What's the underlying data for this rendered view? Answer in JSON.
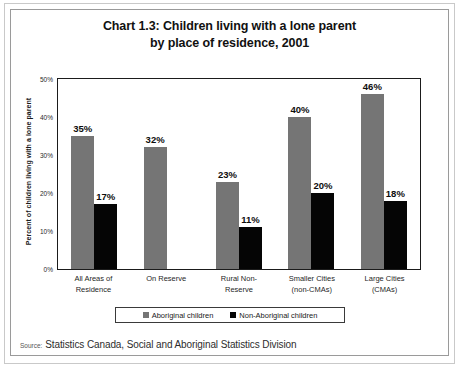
{
  "frame": {
    "title_line1": "Chart 1.3: Children living with a lone parent",
    "title_line2": "by place of residence, 2001"
  },
  "source": {
    "label": "Source:",
    "text": "Statistics Canada, Social and Aboriginal Statistics Division"
  },
  "legend": {
    "items": [
      {
        "label": "Aboriginal children",
        "color": "#757575"
      },
      {
        "label": "Non-Aboriginal children",
        "color": "#050505"
      }
    ]
  },
  "chart_data": {
    "type": "bar",
    "title": "Chart 1.3: Children living with a lone parent by place of residence, 2001",
    "xlabel": "",
    "ylabel": "Percent of children living with a lone parent",
    "ylim": [
      0,
      50
    ],
    "yticks": [
      0,
      10,
      20,
      30,
      40,
      50
    ],
    "ytick_labels": [
      "0%",
      "10%",
      "20%",
      "30%",
      "40%",
      "50%"
    ],
    "grid": false,
    "legend_position": "bottom",
    "categories": [
      "All Areas of Residence",
      "On Reserve",
      "Rural Non-Reserve",
      "Smaller Cities (non-CMAs)",
      "Large Cities (CMAs)"
    ],
    "category_lines": [
      [
        "All Areas of",
        "Residence"
      ],
      [
        "On Reserve",
        ""
      ],
      [
        "Rural Non-",
        "Reserve"
      ],
      [
        "Smaller Cities",
        "(non-CMAs)"
      ],
      [
        "Large Cities",
        "(CMAs)"
      ]
    ],
    "series": [
      {
        "name": "Aboriginal children",
        "color": "#757575",
        "values": [
          35,
          32,
          23,
          40,
          46
        ],
        "labels": [
          "35%",
          "32%",
          "23%",
          "40%",
          "46%"
        ]
      },
      {
        "name": "Non-Aboriginal children",
        "color": "#050505",
        "values": [
          17,
          null,
          11,
          20,
          18
        ],
        "labels": [
          "17%",
          "",
          "11%",
          "20%",
          "18%"
        ]
      }
    ]
  }
}
